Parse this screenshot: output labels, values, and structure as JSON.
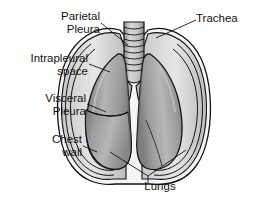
{
  "figure": {
    "style": "grayscale medical line illustration",
    "background_color": "#ffffff",
    "outline_color": "#141414",
    "lung_fill_light": "#b9b9b9",
    "lung_fill_mid": "#9a9a9a",
    "lung_fill_dark": "#7d7d7d",
    "pleura_fill": "#d8d8d8",
    "chest_wall_fill": "#efefef",
    "trachea_fill": "#d2d2d2"
  },
  "labels": {
    "parietal_pleura": "Parietal\nPleura",
    "intrapleural_space": "Intrapleural\nspace",
    "visceral_pleura": "Visceral\nPleura",
    "chest_wall": "Chest\nwall",
    "trachea": "Trachea",
    "lungs": "Lungs"
  },
  "structures": [
    {
      "name": "trachea",
      "description": "cartilage-ringed airway at top center, bifurcating into two bronchi"
    },
    {
      "name": "left-lung",
      "description": "lung on viewer's left, showing upper and lower lobes separated by an oblique fissure"
    },
    {
      "name": "right-lung",
      "description": "lung on viewer's right, single large shaded mass"
    },
    {
      "name": "visceral-pleura",
      "description": "membrane layer hugging the lung surface"
    },
    {
      "name": "intrapleural-space",
      "description": "thin gap between visceral and parietal pleura"
    },
    {
      "name": "parietal-pleura",
      "description": "outer membrane layer lining the chest wall"
    },
    {
      "name": "chest-wall",
      "description": "outermost body wall outline enclosing both lungs"
    }
  ],
  "leader_lines": [
    {
      "from": "parietal_pleura",
      "to": "outer pleural layer, upper left of left lung"
    },
    {
      "from": "intrapleural_space",
      "to": "gap between pleural layers, left mid"
    },
    {
      "from": "visceral_pleura",
      "to": "lung surface membrane, left lower"
    },
    {
      "from": "chest_wall",
      "to": "outer wall, lower left"
    },
    {
      "from": "trachea",
      "to": "tracheal rings at top center"
    },
    {
      "from": "lungs",
      "to": "both lung bodies, forked leader to left and right lung"
    }
  ]
}
